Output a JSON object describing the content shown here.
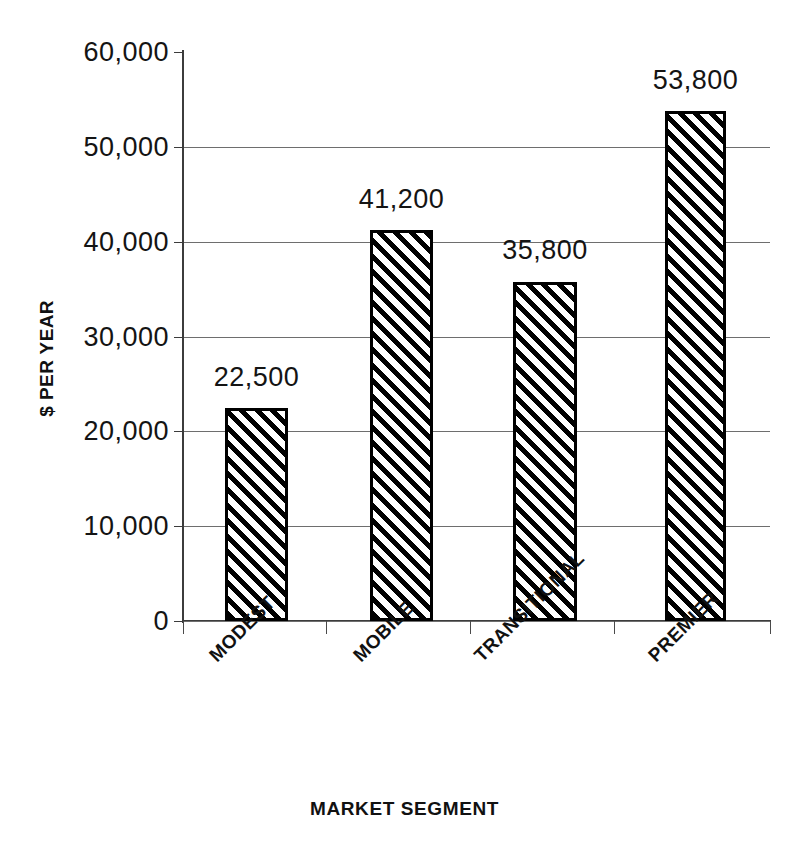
{
  "chart_data": {
    "type": "bar",
    "title": "",
    "categories": [
      "MODEST",
      "MOBILE",
      "TRANSITIONAL",
      "PREMIER"
    ],
    "values": [
      22500,
      41200,
      35800,
      53800
    ],
    "value_labels": [
      "22,500",
      "41,200",
      "35,800",
      "53,800"
    ],
    "xlabel": "MARKET SEGMENT",
    "ylabel": "$ PER YEAR",
    "ylim": [
      0,
      60000
    ],
    "ytick_values": [
      0,
      10000,
      20000,
      30000,
      40000,
      50000,
      60000
    ],
    "ytick_labels": [
      "0",
      "10,000",
      "20,000",
      "30,000",
      "40,000",
      "50,000",
      "60,000"
    ],
    "grid": true,
    "grid_axis": "y",
    "legend": null,
    "bar_fill": "diagonal-hatch",
    "bar_fill_color": "#000000",
    "bar_background": "#ffffff",
    "axis_color": "#3c3c3c",
    "category_label_rotation": -45
  }
}
